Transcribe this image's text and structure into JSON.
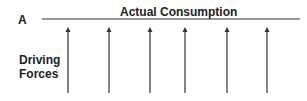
{
  "diagram": {
    "point_label": "A",
    "line_label": "Actual Consumption",
    "forces_label_line1": "Driving",
    "forces_label_line2": "Forces",
    "arrow_count": 6,
    "arrow_x": [
      68,
      109,
      150,
      185,
      227,
      267
    ],
    "line_color": "#333333"
  }
}
